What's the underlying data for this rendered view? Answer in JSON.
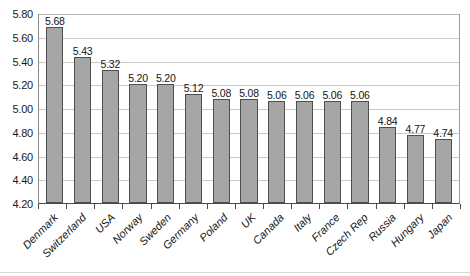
{
  "chart_data": {
    "type": "bar",
    "title": "",
    "xlabel": "",
    "ylabel": "",
    "ylim": [
      4.2,
      5.8
    ],
    "ytick_step": 0.2,
    "grid": true,
    "legend": false,
    "bar_color": "#a6a6a6",
    "bar_border_color": "#4f4f4f",
    "gridline_color": "#c9c9c9",
    "axis_color": "#4a4a4a",
    "label_rotation": -45,
    "categories": [
      "Denmark",
      "Switzerland",
      "USA",
      "Norway",
      "Sweden",
      "Germany",
      "Poland",
      "UK",
      "Canada",
      "Italy",
      "France",
      "Czech Rep",
      "Russia",
      "Hungary",
      "Japan"
    ],
    "values": [
      5.68,
      5.43,
      5.32,
      5.2,
      5.2,
      5.12,
      5.08,
      5.08,
      5.06,
      5.06,
      5.06,
      5.06,
      4.84,
      4.77,
      4.74
    ],
    "data_labels": [
      "5.68",
      "5.43",
      "5.32",
      "5.20",
      "5.20",
      "5.12",
      "5.08",
      "5.08",
      "5.06",
      "5.06",
      "5.06",
      "5.06",
      "4.84",
      "4.77",
      "4.74"
    ],
    "yticks": [
      5.8,
      5.6,
      5.4,
      5.2,
      5.0,
      4.8,
      4.6,
      4.4,
      4.2
    ],
    "ytick_labels": [
      "5.80",
      "5.60",
      "5.40",
      "5.20",
      "5.00",
      "4.80",
      "4.60",
      "4.40",
      "4.20"
    ]
  }
}
